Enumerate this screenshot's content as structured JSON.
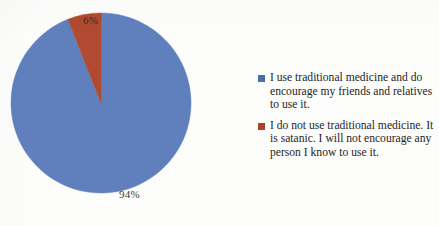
{
  "chart_data": {
    "type": "pie",
    "title": "",
    "categories": [
      "I use traditional medicine and do encourage my friends and relatives to use it.",
      "I do not use traditional medicine. It is satanic. I will not encourage any person I know to use it."
    ],
    "values": [
      94,
      6
    ],
    "data_labels": [
      "94%",
      "6%"
    ],
    "colors": [
      "#6080bd",
      "#b04a30"
    ],
    "legend_position": "right",
    "grid": false,
    "units": "percent",
    "start_angle_deg": 0,
    "direction": "clockwise"
  },
  "pie": {
    "slices": [
      {
        "label": "94%",
        "value": 94,
        "color": "#6080bd",
        "name": "blue-slice"
      },
      {
        "label": "6%",
        "value": 6,
        "color": "#b04a30",
        "name": "red-slice"
      }
    ]
  },
  "legend": {
    "entries": [
      {
        "swatch_color": "#4c6da8",
        "text": "I use traditional medicine and do encourage my friends and relatives to use it."
      },
      {
        "swatch_color": "#a8452c",
        "text": "I do not use traditional medicine. It is satanic. I will not encourage any person I know to use it."
      }
    ]
  },
  "colors": {
    "blue": "#6080bd",
    "red": "#b04a30",
    "legend_blue": "#4c6da8",
    "legend_red": "#a8452c",
    "label_text": "#2b2b2b",
    "legend_text": "#231f1e",
    "background": "#fdfdfc"
  }
}
